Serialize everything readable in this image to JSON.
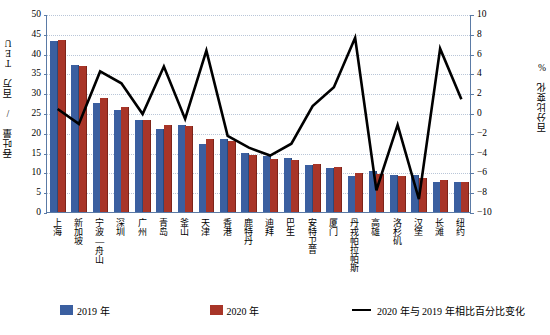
{
  "chart_data": {
    "type": "bar",
    "title": "",
    "xlabel": "",
    "ylabel": "吞吐量 / 百万 TEU",
    "y2label": "百分比变化 %",
    "ylim": [
      0,
      50
    ],
    "y2lim": [
      -10,
      10
    ],
    "yticks": [
      0,
      5,
      10,
      15,
      20,
      25,
      30,
      35,
      40,
      45,
      50
    ],
    "y2ticks": [
      -10,
      -8,
      -6,
      -4,
      -2,
      0,
      2,
      4,
      6,
      8,
      10
    ],
    "grid": true,
    "legend_position": "bottom",
    "categories": [
      "上海",
      "新加坡",
      "宁波—舟山",
      "深圳",
      "广州",
      "青岛",
      "釜山",
      "天津",
      "香港",
      "鹿特丹",
      "迪拜",
      "巴生",
      "安特卫普",
      "厦门",
      "丹戎帕拉帕斯",
      "高雄",
      "洛杉矶",
      "汉堡",
      "长滩",
      "纽约"
    ],
    "series": [
      {
        "name": "2019 年",
        "type": "bar",
        "axis": "left",
        "color": "#3b5fa0",
        "values": [
          43.3,
          37.2,
          27.5,
          25.8,
          23.2,
          21.0,
          21.9,
          17.3,
          18.4,
          14.8,
          14.1,
          13.6,
          11.9,
          11.1,
          9.1,
          10.4,
          9.3,
          9.3,
          7.6,
          7.5
        ]
      },
      {
        "name": "2020 年",
        "type": "bar",
        "axis": "left",
        "color": "#a83528",
        "values": [
          43.5,
          36.9,
          28.7,
          26.6,
          23.2,
          22.0,
          21.8,
          18.4,
          18.0,
          14.3,
          13.5,
          13.2,
          12.0,
          11.4,
          9.8,
          9.6,
          9.2,
          8.5,
          8.1,
          7.6
        ]
      },
      {
        "name": "2020 年与 2019 年相比百分比变化",
        "type": "line",
        "axis": "right",
        "color": "#000000",
        "values": [
          0.5,
          -1.0,
          4.3,
          3.1,
          0.0,
          4.8,
          -0.5,
          6.4,
          -2.2,
          -3.4,
          -4.2,
          -3.0,
          0.8,
          2.7,
          7.7,
          -7.7,
          -1.1,
          -8.6,
          6.6,
          1.5
        ]
      }
    ]
  },
  "legend": {
    "items": [
      {
        "label": "2019 年",
        "swatch": "blue-square"
      },
      {
        "label": "2020 年",
        "swatch": "red-square"
      },
      {
        "label": "2020 年与 2019 年相比百分比变化",
        "swatch": "black-line"
      }
    ]
  }
}
